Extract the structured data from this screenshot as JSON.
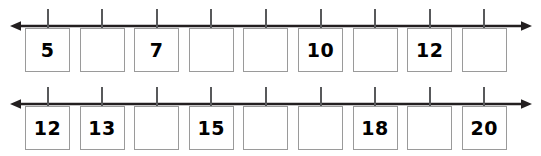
{
  "worksheet": {
    "type": "number-line-fill-in-the-blank",
    "box_count_per_row": 9,
    "colors": {
      "axis": "#231f20",
      "tick": "#58595b",
      "box_border": "#9a9a9a",
      "box_fill": "#ffffff",
      "digit": "#000000",
      "background": "#ffffff"
    },
    "rows": [
      {
        "id": "number-line-1",
        "left_arrow": "arrow-left",
        "right_arrow": "arrow-right",
        "cells": [
          {
            "index": 0,
            "value": "5",
            "filled": true
          },
          {
            "index": 1,
            "value": "",
            "filled": false
          },
          {
            "index": 2,
            "value": "7",
            "filled": true
          },
          {
            "index": 3,
            "value": "",
            "filled": false
          },
          {
            "index": 4,
            "value": "",
            "filled": false
          },
          {
            "index": 5,
            "value": "10",
            "filled": true
          },
          {
            "index": 6,
            "value": "",
            "filled": false
          },
          {
            "index": 7,
            "value": "12",
            "filled": true
          },
          {
            "index": 8,
            "value": "",
            "filled": false
          }
        ]
      },
      {
        "id": "number-line-2",
        "left_arrow": "arrow-left",
        "right_arrow": "arrow-right",
        "cells": [
          {
            "index": 0,
            "value": "12",
            "filled": true
          },
          {
            "index": 1,
            "value": "13",
            "filled": true
          },
          {
            "index": 2,
            "value": "",
            "filled": false
          },
          {
            "index": 3,
            "value": "15",
            "filled": true
          },
          {
            "index": 4,
            "value": "",
            "filled": false
          },
          {
            "index": 5,
            "value": "",
            "filled": false
          },
          {
            "index": 6,
            "value": "18",
            "filled": true
          },
          {
            "index": 7,
            "value": "",
            "filled": false
          },
          {
            "index": 8,
            "value": "20",
            "filled": true
          }
        ]
      }
    ]
  }
}
